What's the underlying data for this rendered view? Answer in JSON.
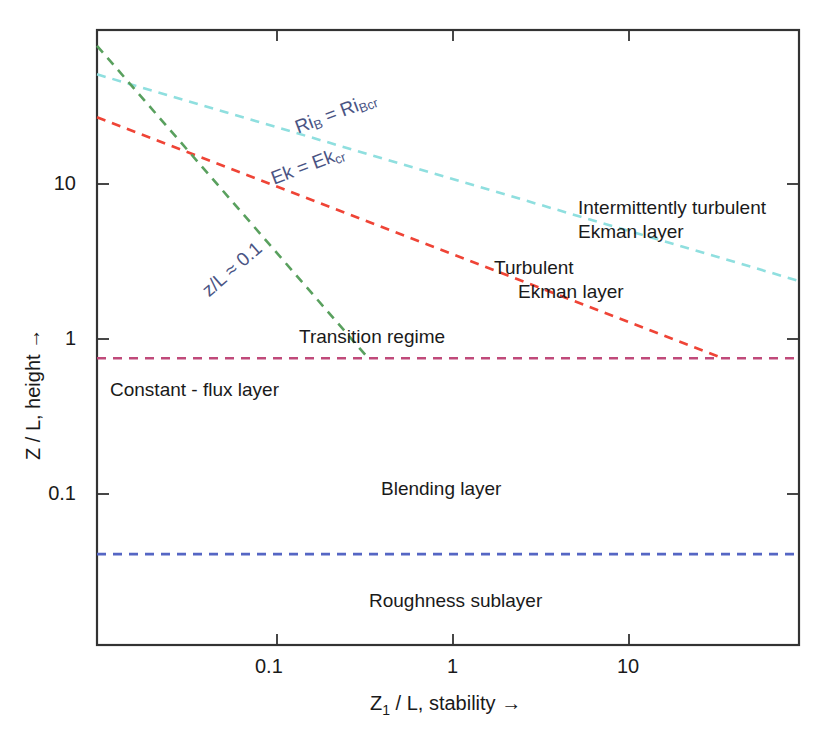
{
  "chart_data": {
    "type": "line",
    "title": "",
    "xlabel": "Z₁ / L, stability →",
    "ylabel": "Z / L, height →",
    "xscale": "log",
    "yscale": "log",
    "xlim": [
      0.0095,
      92.0
    ],
    "ylim": [
      0.0136,
      11.9
    ],
    "grid": false,
    "legend": "none",
    "xticks": [
      {
        "value": 0.1,
        "label": "0.1"
      },
      {
        "value": 1,
        "label": "1"
      },
      {
        "value": 10,
        "label": "10"
      }
    ],
    "yticks": [
      {
        "value": 10,
        "label": "10"
      },
      {
        "value": 1,
        "label": "1"
      },
      {
        "value": 0.1,
        "label": "0.1"
      }
    ],
    "series": [
      {
        "name": "Ri_B = Ri_Bcr",
        "color": "#8fdfdf",
        "style": "dashed",
        "points": [
          [
            0.0095,
            7.3
          ],
          [
            92.0,
            0.75
          ]
        ]
      },
      {
        "name": "Ek = Ek_cr",
        "color": "#ef4436",
        "style": "dashed",
        "points": [
          [
            0.0095,
            4.55
          ],
          [
            34.0,
            0.32
          ]
        ]
      },
      {
        "name": "z/L = 0.1",
        "color": "#59a05e",
        "style": "dashed",
        "points": [
          [
            0.0095,
            10.0
          ],
          [
            0.33,
            0.32
          ]
        ]
      },
      {
        "name": "constant-flux layer top",
        "color": "#c04a7a",
        "style": "dashed",
        "points": [
          [
            0.0095,
            0.32
          ],
          [
            92.0,
            0.32
          ]
        ]
      },
      {
        "name": "roughness sublayer top",
        "color": "#5566c4",
        "style": "dashed",
        "points": [
          [
            0.0095,
            0.037
          ],
          [
            92.0,
            0.037
          ]
        ]
      }
    ],
    "annotations": [
      {
        "name": "intermittently-turbulent-ekman-layer",
        "text": "Intermittently turbulent\nEkman layer",
        "x": 0.58,
        "y": 0.71,
        "rotation": 0,
        "color": "#1a1a1a"
      },
      {
        "name": "turbulent-ekman-layer",
        "text": "Turbulent\n  Ekman layer",
        "x": 0.5,
        "y": 0.6,
        "rotation": 0,
        "color": "#1a1a1a"
      },
      {
        "name": "transition-regime",
        "text": "Transition regime",
        "x": 0.28,
        "y": 0.5,
        "rotation": 0,
        "color": "#1a1a1a"
      },
      {
        "name": "constant-flux-layer",
        "text": "Constant - flux layer",
        "x": 0.02,
        "y": 0.375,
        "rotation": 0,
        "color": "#1a1a1a"
      },
      {
        "name": "blending-layer",
        "text": "Blending layer",
        "x": 0.4,
        "y": 0.24,
        "rotation": 0,
        "color": "#1a1a1a"
      },
      {
        "name": "roughness-sublayer",
        "text": "Roughness sublayer",
        "x": 0.38,
        "y": 0.075,
        "rotation": 0,
        "color": "#1a1a1a"
      },
      {
        "name": "ri-b-label",
        "text": "Riᴮ = Riʙcr",
        "rotation": -20.5,
        "color": "#4a5484"
      },
      {
        "name": "ek-label",
        "text": "Ek = Ekᴄʀ",
        "rotation": -20.5,
        "color": "#4a5484"
      },
      {
        "name": "z-over-l-label",
        "text": "z/L ≈ 0.1",
        "rotation": -41.0,
        "color": "#4a5484"
      }
    ]
  },
  "axes": {
    "x_title": "Z₁ / L, stability →",
    "y_title": "Z / L, height →",
    "x_tick_labels": [
      "0.1",
      "1",
      "10"
    ],
    "y_tick_labels": [
      "10",
      "1",
      "0.1"
    ]
  },
  "regions": {
    "intermittently_turbulent_line1": "Intermittently turbulent",
    "intermittently_turbulent_line2": "Ekman layer",
    "turbulent_line1": "Turbulent",
    "turbulent_line2": "Ekman layer",
    "transition_regime": "Transition regime",
    "constant_flux_layer": "Constant - flux layer",
    "blending_layer": "Blending layer",
    "roughness_sublayer": "Roughness sublayer"
  },
  "curve_labels": {
    "ri_b_prefix": "Ri",
    "ri_b_sub1": "B",
    "ri_b_eq": " = Ri",
    "ri_b_sub2": "Bcr",
    "ek_prefix": "Ek = Ek",
    "ek_sub": "cr",
    "z_over_l": "z/L ≈ 0.1"
  },
  "colors": {
    "frame": "#333333",
    "cyan_curve": "#8fdfdf",
    "red_curve": "#ef4436",
    "green_curve": "#59a05e",
    "magenta_line": "#c04a7a",
    "blue_line": "#5566c4",
    "label_blue": "#4a5484",
    "text": "#1a1a1a"
  }
}
